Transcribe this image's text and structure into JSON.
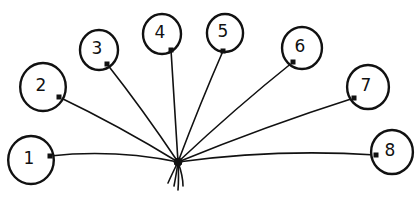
{
  "diagram": {
    "title": "",
    "colors": {
      "ink": "#111111",
      "background": "#ffffff"
    },
    "knot": {
      "x": 178,
      "y": 162
    },
    "balloons": [
      {
        "label": "1",
        "cx": 31,
        "cy": 160,
        "r": 24,
        "attach_x": 50,
        "attach_y": 156
      },
      {
        "label": "2",
        "cx": 43,
        "cy": 87,
        "r": 24,
        "attach_x": 59,
        "attach_y": 97
      },
      {
        "label": "3",
        "cx": 99,
        "cy": 50,
        "r": 20,
        "attach_x": 107,
        "attach_y": 64
      },
      {
        "label": "4",
        "cx": 162,
        "cy": 34,
        "r": 20,
        "attach_x": 171,
        "attach_y": 50
      },
      {
        "label": "5",
        "cx": 225,
        "cy": 33,
        "r": 19,
        "attach_x": 223,
        "attach_y": 51
      },
      {
        "label": "6",
        "cx": 302,
        "cy": 48,
        "r": 21,
        "attach_x": 293,
        "attach_y": 62
      },
      {
        "label": "7",
        "cx": 368,
        "cy": 87,
        "r": 22,
        "attach_x": 354,
        "attach_y": 98
      },
      {
        "label": "8",
        "cx": 392,
        "cy": 152,
        "r": 22,
        "attach_x": 376,
        "attach_y": 155
      }
    ]
  }
}
